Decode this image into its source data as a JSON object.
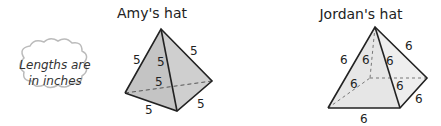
{
  "amy": {
    "title": "Amy's hat",
    "labels": [
      "5",
      "5",
      "5",
      "5",
      "5",
      "5"
    ]
  },
  "jordan": {
    "title": "Jordan's hat",
    "labels": [
      "6",
      "6",
      "6",
      "6",
      "6",
      "6",
      "6",
      "6"
    ]
  },
  "note": {
    "line1": "Lengths are",
    "line2": "in inches"
  },
  "colors": {
    "face_dark": "#c8c8c8",
    "face_light": "#e8e8e8",
    "edge": "#222222",
    "cloud_border": "#bbbbbb"
  }
}
